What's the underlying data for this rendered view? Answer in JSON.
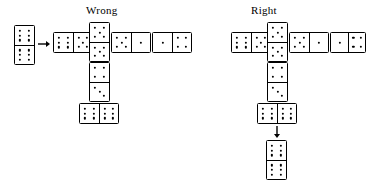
{
  "figure": {
    "type": "domino-layout-comparison",
    "background_color": "#ffffff",
    "ink_color": "#000000"
  },
  "labels": {
    "wrong": "Wrong",
    "right": "Right"
  },
  "hand_tile": {
    "name": "tile-to-play",
    "orientation": "vertical",
    "top": 6,
    "bottom": 6
  },
  "arrows": [
    {
      "name": "play-arrow-left",
      "direction": "right"
    },
    {
      "name": "play-arrow-down",
      "direction": "down"
    }
  ],
  "wrong_layout": {
    "title": "Wrong",
    "row": [
      {
        "name": "domino-6-5",
        "orientation": "horizontal",
        "left": 6,
        "right": 5
      },
      {
        "name": "domino-5-5-center",
        "orientation": "vertical",
        "top": 5,
        "bottom": 5
      },
      {
        "name": "domino-5-1",
        "orientation": "horizontal",
        "left": 5,
        "right": 1
      },
      {
        "name": "domino-1-4",
        "orientation": "horizontal",
        "left": 1,
        "right": 4
      }
    ],
    "branch": [
      {
        "name": "domino-4-3",
        "orientation": "vertical",
        "top": 4,
        "bottom": 3
      },
      {
        "name": "domino-6-6-branch",
        "orientation": "horizontal",
        "left": 6,
        "right": 6
      }
    ]
  },
  "right_layout": {
    "title": "Right",
    "row": [
      {
        "name": "domino-6-5",
        "orientation": "horizontal",
        "left": 6,
        "right": 5
      },
      {
        "name": "domino-5-5-center",
        "orientation": "vertical",
        "top": 5,
        "bottom": 5
      },
      {
        "name": "domino-5-1",
        "orientation": "horizontal",
        "left": 5,
        "right": 1
      },
      {
        "name": "domino-1-4",
        "orientation": "horizontal",
        "left": 1,
        "right": 4
      }
    ],
    "branch": [
      {
        "name": "domino-4-3",
        "orientation": "vertical",
        "top": 4,
        "bottom": 3
      },
      {
        "name": "domino-6-6-branch",
        "orientation": "horizontal",
        "left": 6,
        "right": 6
      }
    ],
    "played_tile": {
      "name": "domino-6-6-played",
      "orientation": "vertical",
      "top": 6,
      "bottom": 6
    }
  }
}
